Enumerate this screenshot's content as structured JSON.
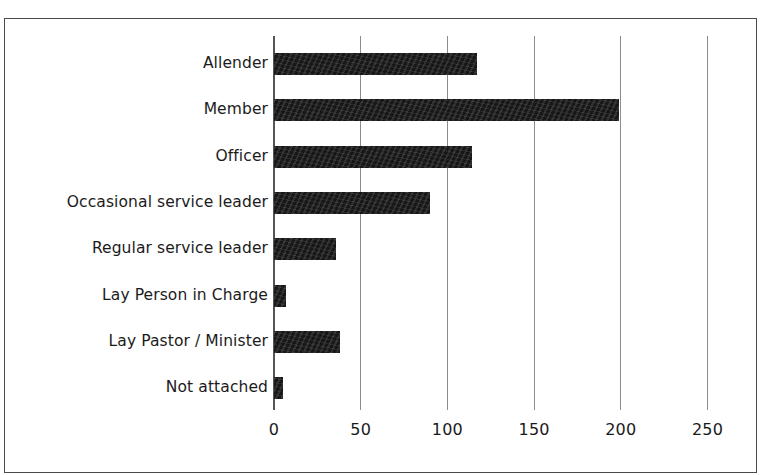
{
  "figure": {
    "ghost_caption_text": "",
    "frame_color": "#4a4a4a",
    "background": "#ffffff",
    "bar_color": "#171717",
    "gridline_color": "#8d8d8d"
  },
  "chart_data": {
    "type": "bar",
    "orientation": "horizontal",
    "title": "",
    "subtitle": "",
    "xlabel": "",
    "ylabel": "",
    "categories": [
      "Allender",
      "Member",
      "Officer",
      "Occasional service leader",
      "Regular service leader",
      "Lay Person in Charge",
      "Lay Pastor / Minister",
      "Not attached"
    ],
    "values": [
      117,
      199,
      114,
      90,
      36,
      7,
      38,
      5
    ],
    "xticks": [
      0,
      50,
      100,
      150,
      200,
      250
    ],
    "xtick_labels": [
      "0",
      "50",
      "100",
      "150",
      "200",
      "250"
    ],
    "xlim": [
      0,
      250
    ],
    "grid": true,
    "grid_axis": "x",
    "legend": false,
    "legend_position": "none"
  }
}
